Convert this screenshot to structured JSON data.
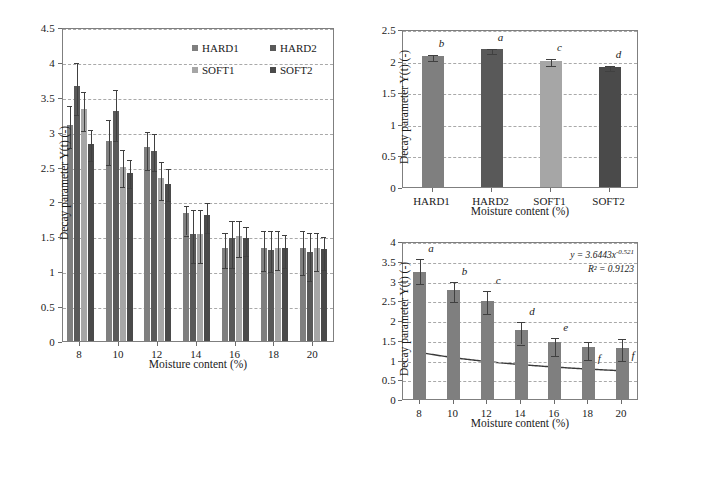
{
  "figure": {
    "panels": [
      "left-grouped-bar-chart",
      "top-right-bar-chart",
      "bottom-right-bar-chart-with-fit"
    ]
  },
  "colors": {
    "hard1": "#7f7f7f",
    "hard2": "#595959",
    "soft1": "#a6a6a6",
    "soft2": "#4a4a4a",
    "axis": "#7f7f7f",
    "grid": "#a9a9a9",
    "error": "#404040",
    "curve": "#3a3a3a"
  },
  "left": {
    "ylabel": "Decay parameter Y(t) (-)",
    "xlabel": "Moisture content (%)",
    "yticks": [
      "0",
      "0.5",
      "1",
      "1.5",
      "2",
      "2.5",
      "3",
      "3.5",
      "4",
      "4.5"
    ],
    "xticks": [
      "8",
      "10",
      "12",
      "14",
      "16",
      "18",
      "20"
    ],
    "legend": [
      {
        "label": "HARD1",
        "color": "#7f7f7f"
      },
      {
        "label": "HARD2",
        "color": "#595959"
      },
      {
        "label": "SOFT1",
        "color": "#a6a6a6"
      },
      {
        "label": "SOFT2",
        "color": "#4a4a4a"
      }
    ]
  },
  "topright": {
    "ylabel": "Decay parameter Y(t) (-)",
    "xlabel": "Moisture content (%)",
    "yticks": [
      "0",
      "0.5",
      "1",
      "1.5",
      "2",
      "2.5"
    ],
    "xticks": [
      "HARD1",
      "HARD2",
      "SOFT1",
      "SOFT2"
    ]
  },
  "bottomright": {
    "ylabel": "Decay parameter Y(t) (-)",
    "xlabel": "Moisture content (%)",
    "yticks": [
      "0",
      "0.5",
      "1",
      "1.5",
      "2",
      "2.5",
      "3",
      "3.5",
      "4"
    ],
    "xticks": [
      "8",
      "10",
      "12",
      "14",
      "16",
      "18",
      "20"
    ],
    "equation": "y = 3.6443x",
    "equation_exponent": "-0.521",
    "rsquared": "R² = 0.9123"
  },
  "chart_data": [
    {
      "id": "left-grouped-bar-chart",
      "type": "bar",
      "title": "",
      "xlabel": "Moisture content (%)",
      "ylabel": "Decay parameter Y(t) (-)",
      "categories": [
        8,
        10,
        12,
        14,
        16,
        18,
        20
      ],
      "ylim": [
        0,
        4.5
      ],
      "ytick_step": 0.5,
      "grid": true,
      "legend_position": "top-right-inside",
      "series": [
        {
          "name": "HARD1",
          "color": "#7f7f7f",
          "values": [
            3.1,
            2.87,
            2.78,
            1.84,
            1.33,
            1.33,
            1.33
          ],
          "err_lower": [
            0.3,
            0.32,
            0.3,
            0.3,
            0.26,
            0.3,
            0.35
          ],
          "err_upper": [
            0.3,
            0.32,
            0.25,
            0.12,
            0.25,
            0.27,
            0.28
          ]
        },
        {
          "name": "HARD2",
          "color": "#595959",
          "values": [
            3.65,
            3.3,
            2.72,
            1.54,
            1.48,
            1.3,
            1.27
          ],
          "err_lower": [
            0.38,
            0.4,
            0.25,
            0.39,
            0.4,
            0.28,
            0.38
          ],
          "err_upper": [
            0.37,
            0.33,
            0.28,
            0.36,
            0.27,
            0.3,
            0.3
          ]
        },
        {
          "name": "SOFT1",
          "color": "#a6a6a6",
          "values": [
            3.32,
            2.49,
            2.33,
            1.53,
            1.51,
            1.33,
            1.33
          ],
          "err_lower": [
            0.28,
            0.26,
            0.28,
            0.38,
            0.28,
            0.28,
            0.3
          ],
          "err_upper": [
            0.28,
            0.27,
            0.27,
            0.38,
            0.24,
            0.27,
            0.24
          ]
        },
        {
          "name": "SOFT2",
          "color": "#4a4a4a",
          "values": [
            2.83,
            2.41,
            2.25,
            1.8,
            1.47,
            1.34,
            1.32
          ],
          "err_lower": [
            0.22,
            0.19,
            0.22,
            0.22,
            0.22,
            0.27,
            0.27
          ],
          "err_upper": [
            0.22,
            0.22,
            0.25,
            0.2,
            0.2,
            0.21,
            0.2
          ]
        }
      ]
    },
    {
      "id": "top-right-bar-chart",
      "type": "bar",
      "title": "",
      "xlabel": "Moisture content (%)",
      "ylabel": "Decay parameter Y(t) (-)",
      "categories": [
        "HARD1",
        "HARD2",
        "SOFT1",
        "SOFT2"
      ],
      "ylim": [
        0,
        2.5
      ],
      "ytick_step": 0.5,
      "grid": true,
      "values": [
        2.07,
        2.18,
        2.0,
        1.9
      ],
      "err_lower": [
        0.05,
        0.04,
        0.05,
        0.04
      ],
      "err_upper": [
        0.05,
        0.04,
        0.06,
        0.04
      ],
      "bar_colors": [
        "#7f7f7f",
        "#595959",
        "#a6a6a6",
        "#4a4a4a"
      ],
      "sig_labels": [
        "b",
        "a",
        "c",
        "d"
      ]
    },
    {
      "id": "bottom-right-bar-chart-with-fit",
      "type": "bar",
      "title": "",
      "xlabel": "Moisture content (%)",
      "ylabel": "Decay parameter Y(t) (-)",
      "categories": [
        8,
        10,
        12,
        14,
        16,
        18,
        20
      ],
      "ylim": [
        0,
        4
      ],
      "ytick_step": 0.5,
      "grid": true,
      "values": [
        3.22,
        2.76,
        2.48,
        1.76,
        1.44,
        1.32,
        1.3
      ],
      "err_lower": [
        0.25,
        0.25,
        0.28,
        0.33,
        0.3,
        0.29,
        0.28
      ],
      "err_upper": [
        0.37,
        0.26,
        0.3,
        0.25,
        0.16,
        0.18,
        0.26
      ],
      "bar_color": "#7f7f7f",
      "sig_labels": [
        "a",
        "b",
        "c",
        "d",
        "e",
        "f",
        "f"
      ],
      "fit": {
        "type": "power",
        "a": 3.6443,
        "b": -0.521,
        "r2": 0.9123,
        "equation_text": "y = 3.6443x-0.521",
        "r2_text": "R² = 0.9123"
      }
    }
  ]
}
